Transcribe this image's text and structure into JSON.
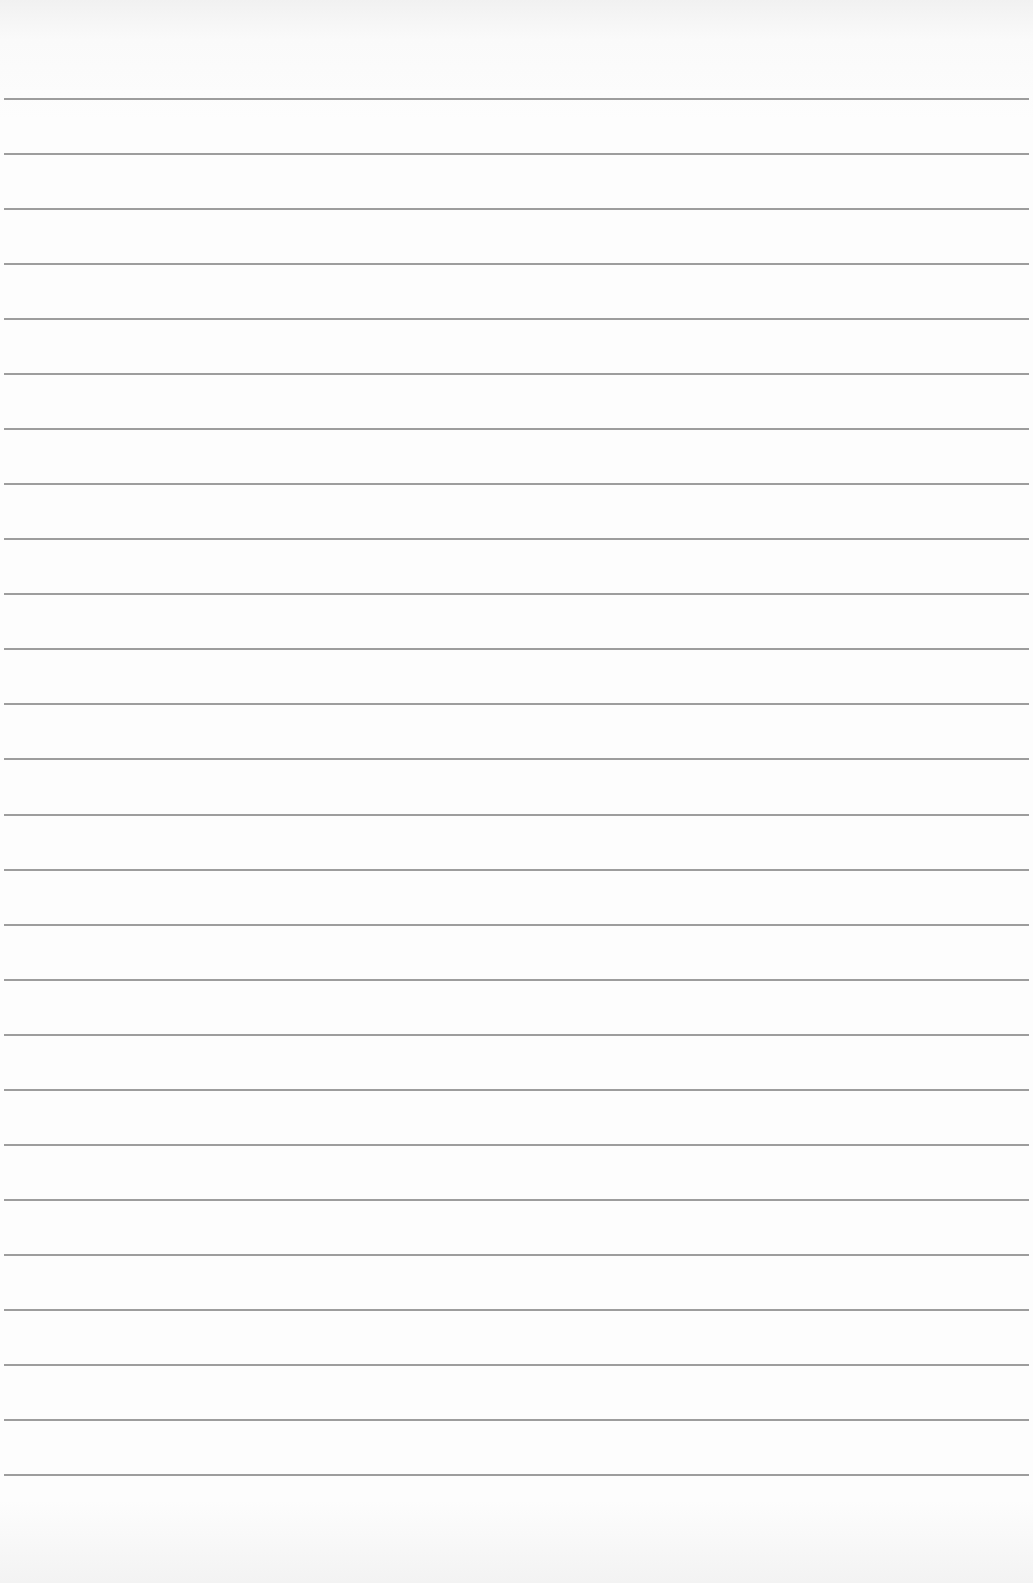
{
  "page": {
    "type": "blank lined paper",
    "background_color": "#fdfdfd",
    "rule_color": "#8c8c8c"
  },
  "rules": {
    "count": 26,
    "first_y": 98,
    "spacing": 55.04
  }
}
